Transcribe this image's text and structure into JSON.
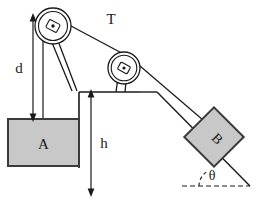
{
  "figure": {
    "labels": {
      "tension": "T",
      "distance_d": "d",
      "height_h": "h",
      "block_a": "A",
      "block_b": "B",
      "angle": "θ"
    },
    "colors": {
      "line": "#1a1a1a",
      "block_fill": "#c8c8c8",
      "block_stroke": "#3a3a3a",
      "background": "#ffffff",
      "pulley_fill": "#ffffff"
    },
    "elements": {
      "block_a_name": "block A",
      "block_b_name": "block B",
      "left_pulley_name": "left pulley",
      "right_pulley_name": "right pulley",
      "rope_name": "rope under tension T",
      "incline_name": "inclined plane",
      "platform_name": "support platform",
      "dimension_d_name": "vertical distance d",
      "dimension_h_name": "vertical height h",
      "angle_name": "incline angle theta"
    }
  }
}
